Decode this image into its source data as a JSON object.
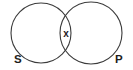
{
  "figure": {
    "background_color": "#ffffff",
    "stroke_color": "#3b3b3b",
    "label_color": "#1d1d1d",
    "width": 133,
    "height": 70
  },
  "circles": [
    {
      "id": "left",
      "label": "S",
      "label_name": "subject-term",
      "cx": 41,
      "cy": 33,
      "r": 30,
      "label_x": 14,
      "label_y": 63
    },
    {
      "id": "right",
      "label": "P",
      "label_name": "predicate-term",
      "cx": 91,
      "cy": 33,
      "r": 31,
      "label_x": 115,
      "label_y": 63
    }
  ],
  "marks": [
    {
      "id": "intersection-mark",
      "symbol": "x",
      "region": "intersection",
      "x": 66,
      "y": 37
    }
  ],
  "chart_data": {
    "type": "diagram",
    "subtype": "venn",
    "set_count": 2,
    "sets": [
      "S",
      "P"
    ],
    "title": "",
    "regions": [
      {
        "name": "S only",
        "sets": [
          "S"
        ],
        "content": ""
      },
      {
        "name": "S and P",
        "sets": [
          "S",
          "P"
        ],
        "content": "x"
      },
      {
        "name": "P only",
        "sets": [
          "P"
        ],
        "content": ""
      }
    ],
    "legend": "none",
    "grid": false,
    "annotations": [
      "x"
    ]
  }
}
